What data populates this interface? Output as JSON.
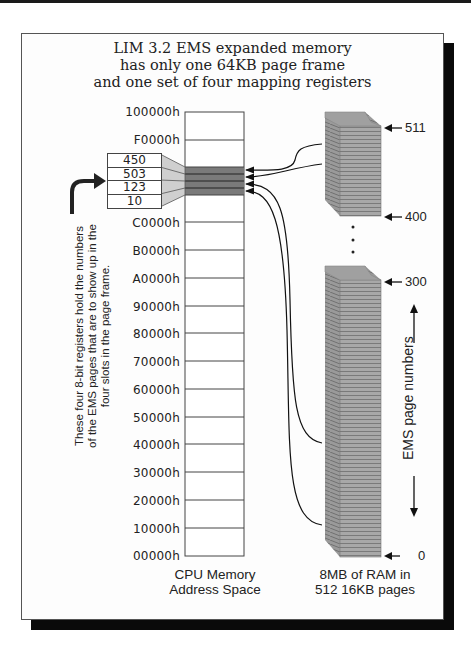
{
  "title": {
    "lines": [
      "LIM 3.2 EMS expanded memory",
      "has only one 64KB page frame",
      "and one set of four mapping registers"
    ]
  },
  "cpu_memory": {
    "address_labels": [
      "100000h",
      "F0000h",
      "E0000h",
      "D0000h",
      "C0000h",
      "B0000h",
      "A0000h",
      "90000h",
      "80000h",
      "70000h",
      "60000h",
      "50000h",
      "40000h",
      "30000h",
      "20000h",
      "10000h",
      "00000h"
    ],
    "visible_address_labels": [
      "100000h",
      "F0000h",
      "C0000h",
      "B0000h",
      "A0000h",
      "90000h",
      "80000h",
      "70000h",
      "60000h",
      "50000h",
      "40000h",
      "30000h",
      "20000h",
      "10000h",
      "00000h"
    ],
    "caption": [
      "CPU Memory",
      "Address Space"
    ],
    "page_frame_color": "#7a7a7a"
  },
  "registers": {
    "values": [
      "450",
      "503",
      "123",
      "10"
    ],
    "note": [
      "These four 8-bit registers hold the numbers",
      "of the EMS pages that are to show up in the",
      "four slots in the page frame."
    ]
  },
  "ems_ram": {
    "page_markers": [
      "511",
      "400",
      "300",
      "0"
    ],
    "axis_label": "EMS page numbers",
    "caption": [
      "8MB of RAM in",
      "512 16KB pages"
    ],
    "stack_color": "#a8a8a8",
    "continuation": "…"
  }
}
